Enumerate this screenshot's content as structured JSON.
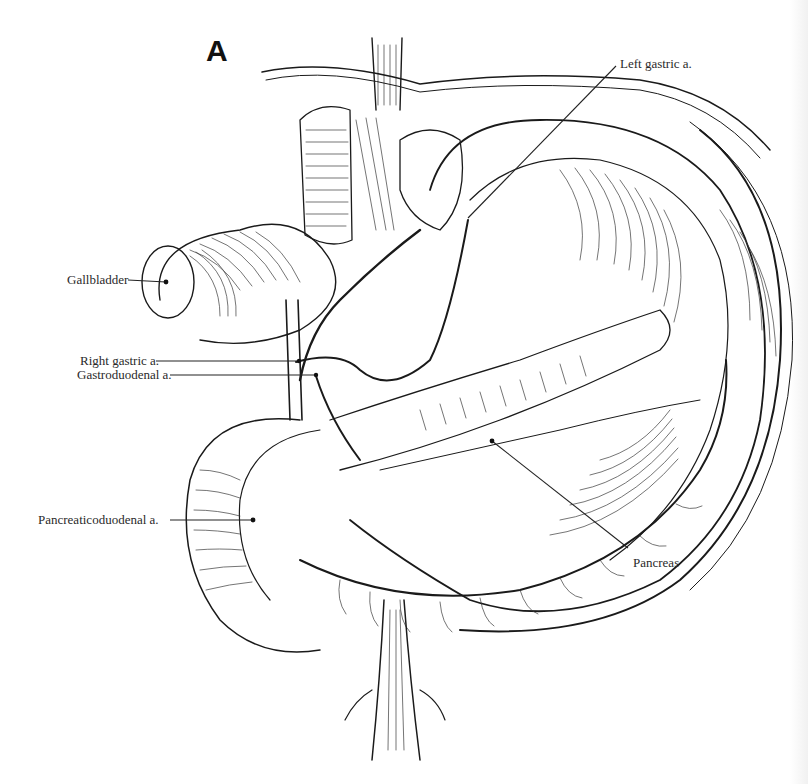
{
  "figure": {
    "panel_letter": "A",
    "background": "#ffffff",
    "ink_color": "#1a1a1a"
  },
  "labels": [
    {
      "id": "left-gastric",
      "text": "Left gastric a.",
      "x": 620,
      "y": 57,
      "leader": {
        "x1": 616,
        "y1": 66,
        "x2": 468,
        "y2": 218
      }
    },
    {
      "id": "gallbladder",
      "text": "Gallbladder",
      "x": 67,
      "y": 273,
      "leader": {
        "x1": 128,
        "y1": 280,
        "x2": 166,
        "y2": 282
      }
    },
    {
      "id": "right-gastric",
      "text": "Right gastric a.",
      "x": 80,
      "y": 354,
      "leader": {
        "x1": 156,
        "y1": 361,
        "x2": 299,
        "y2": 361
      }
    },
    {
      "id": "gastroduodenal",
      "text": "Gastroduodenal a.",
      "x": 77,
      "y": 368,
      "leader": {
        "x1": 170,
        "y1": 375,
        "x2": 316,
        "y2": 375
      }
    },
    {
      "id": "pancreaticoduodenal",
      "text": "Pancreaticoduodenal a.",
      "x": 38,
      "y": 513,
      "leader": {
        "x1": 170,
        "y1": 520,
        "x2": 253,
        "y2": 520
      }
    },
    {
      "id": "pancreas",
      "text": "Pancreas",
      "x": 633,
      "y": 556,
      "leader": {
        "x1": 628,
        "y1": 548,
        "x2": 492,
        "y2": 441
      }
    }
  ]
}
